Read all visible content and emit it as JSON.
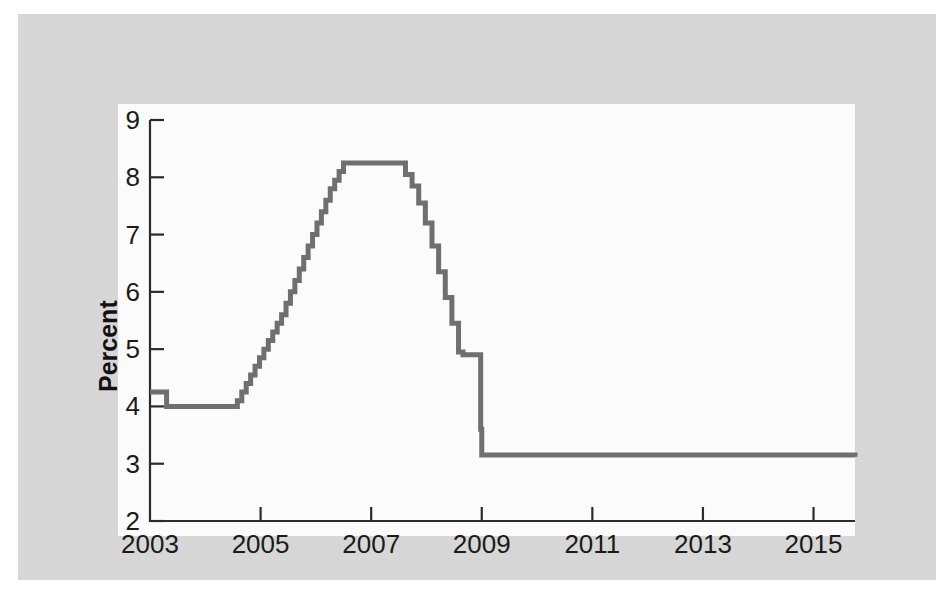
{
  "page": {
    "background_color": "#d9d9d9",
    "panel_color": "#fbfbfb",
    "ghost_lines": [
      "commercial banks with small and medium",
      "credit by commercial banks. Figure 2 shows",
      "outstanding stock of loans extended by commercial",
      "the borrowers, guarantees based on the",
      "and other financing.",
      "As a consequence of the banking crisis, the domestic",
      "credit channel to the private sector collapsed. The",
      "outstanding stock of loans granted to the private sector",
      "contracted. The decline in lending was accompanied",
      "by a sharp increase in non-performing loans, in",
      "part reflecting the recession that followed the",
      "banking crisis."
    ]
  },
  "chart_data": {
    "type": "line",
    "title": "",
    "xlabel": "",
    "ylabel": "Percent",
    "xlim": [
      2003.0,
      2015.75
    ],
    "ylim": [
      2,
      9
    ],
    "xticks": [
      "2003",
      "2005",
      "2007",
      "2009",
      "2011",
      "2013",
      "2015"
    ],
    "xtick_values": [
      2003,
      2005,
      2007,
      2009,
      2011,
      2013,
      2015
    ],
    "yticks": [
      "2",
      "3",
      "4",
      "5",
      "6",
      "7",
      "8",
      "9"
    ],
    "ytick_values": [
      2,
      3,
      4,
      5,
      6,
      7,
      8,
      9
    ],
    "grid": false,
    "legend": "none",
    "line_color": "#6f6f6f",
    "series": [
      {
        "name": "Policy interest rate",
        "step": "post",
        "x": [
          2003.0,
          2003.25,
          2003.3,
          2004.5,
          2004.58,
          2004.66,
          2004.74,
          2004.82,
          2004.9,
          2004.98,
          2005.06,
          2005.14,
          2005.22,
          2005.3,
          2005.38,
          2005.46,
          2005.54,
          2005.62,
          2005.7,
          2005.78,
          2005.86,
          2005.94,
          2006.02,
          2006.1,
          2006.18,
          2006.26,
          2006.34,
          2006.42,
          2006.5,
          2007.5,
          2007.62,
          2007.74,
          2007.86,
          2007.98,
          2008.1,
          2008.22,
          2008.34,
          2008.46,
          2008.58,
          2008.66,
          2008.9,
          2008.98,
          2009.0,
          2015.75
        ],
        "y": [
          4.25,
          4.25,
          4.0,
          4.0,
          4.1,
          4.25,
          4.4,
          4.55,
          4.7,
          4.85,
          5.0,
          5.15,
          5.3,
          5.45,
          5.6,
          5.8,
          6.0,
          6.2,
          6.4,
          6.6,
          6.8,
          7.0,
          7.2,
          7.4,
          7.6,
          7.8,
          7.95,
          8.1,
          8.25,
          8.25,
          8.05,
          7.85,
          7.55,
          7.2,
          6.8,
          6.35,
          5.9,
          5.45,
          4.95,
          4.9,
          4.9,
          3.6,
          3.15,
          3.12
        ]
      }
    ],
    "annotations": [
      {
        "label": "starting level",
        "value": 4.25,
        "year": 2003
      },
      {
        "label": "trough before tightening",
        "value": 4.0,
        "year": 2004
      },
      {
        "label": "peak plateau",
        "value": 8.25,
        "year": 2007
      },
      {
        "label": "intermediate step",
        "value": 4.9,
        "year": 2008.7
      },
      {
        "label": "post-crisis flat level",
        "value": 3.15,
        "year": 2009
      }
    ]
  }
}
